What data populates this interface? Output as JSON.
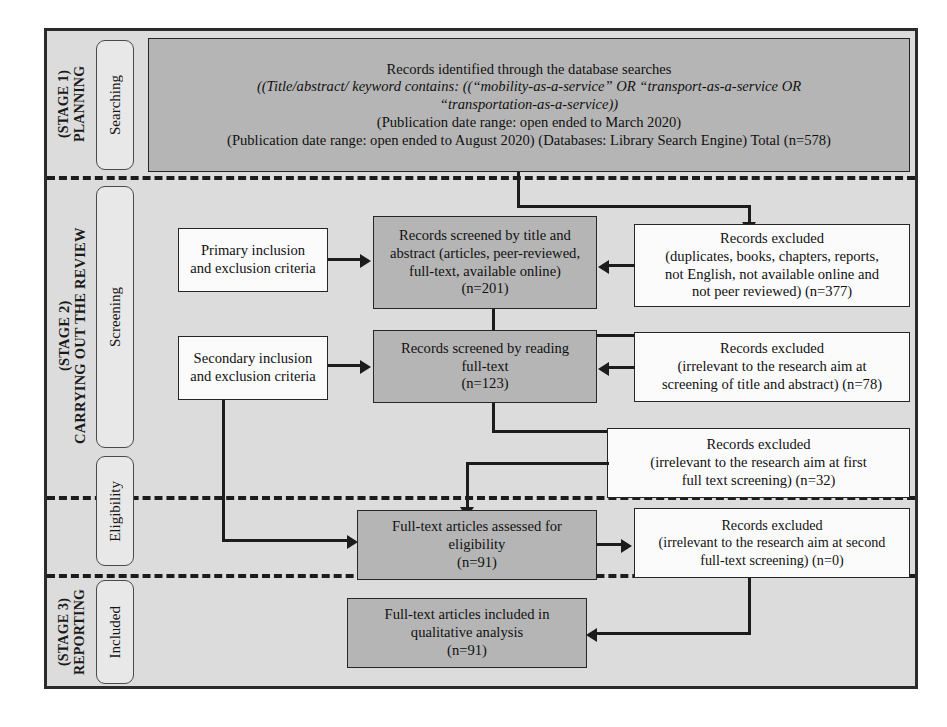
{
  "figure": {
    "type": "prisma-flow-diagram",
    "colors": {
      "frame_background": "#dcdcdc",
      "frame_border": "#2b2b2b",
      "filled_node": "#b5b5b5",
      "plain_node": "#fbfbfb",
      "connector": "#1c1c1c",
      "phase_pill": "#e8e8e8"
    }
  },
  "stages": [
    {
      "id": "stage-1",
      "label": "(STAGE 1)\nPLANNING",
      "phase": "Searching"
    },
    {
      "id": "stage-2",
      "label": "(STAGE 2)\nCARRYING OUT THE REVIEW",
      "phases": [
        "Screening",
        "Eligibility"
      ]
    },
    {
      "id": "stage-3",
      "label": "(STAGE 3)\nREPORTING",
      "phase": "Included"
    }
  ],
  "nodes": {
    "identified": {
      "lines": [
        "Records identified through the database searches",
        "((Title/abstract/ keyword contains: ((“mobility-as-a-service” OR  “transport-as-a-service OR",
        "“transportation-as-a-service))",
        "(Publication date range: open ended to March 2020)",
        "(Publication date range: open ended to August 2020) (Databases: Library Search Engine) Total (n=578)"
      ],
      "italic_lines": [
        1,
        2
      ],
      "count": "n=578"
    },
    "primary_criteria": {
      "lines": [
        "Primary inclusion",
        "and exclusion criteria"
      ]
    },
    "secondary_criteria": {
      "lines": [
        "Secondary inclusion",
        "and exclusion criteria"
      ]
    },
    "screened_title_abstract": {
      "lines": [
        "Records screened by title and",
        "abstract (articles, peer-reviewed,",
        "full-text, available online)",
        "(n=201)"
      ],
      "count": "n=201"
    },
    "excluded_duplicates": {
      "lines": [
        "Records excluded",
        "(duplicates, books, chapters, reports,",
        "not English, not available online and",
        "not peer reviewed) (n=377)"
      ],
      "count": "n=377"
    },
    "screened_fulltext": {
      "lines": [
        "Records screened by reading",
        "full-text",
        "(n=123)"
      ],
      "count": "n=123"
    },
    "excluded_title_abstract": {
      "lines": [
        "Records excluded",
        "(irrelevant to the research aim at",
        "screening of title and abstract) (n=78)"
      ],
      "count": "n=78"
    },
    "excluded_first_fulltext": {
      "lines": [
        "Records excluded",
        "(irrelevant to the research aim at first",
        "full text screening) (n=32)"
      ],
      "count": "n=32"
    },
    "assessed_eligibility": {
      "lines": [
        "Full-text articles assessed for",
        "eligibility",
        "(n=91)"
      ],
      "count": "n=91"
    },
    "excluded_second_fulltext": {
      "lines": [
        "Records excluded",
        "(irrelevant to the research aim at second",
        "full-text screening) (n=0)"
      ],
      "count": "n=0"
    },
    "included_qualitative": {
      "lines": [
        "Full-text articles included in",
        "qualitative analysis",
        "(n=91)"
      ],
      "count": "n=91"
    }
  }
}
